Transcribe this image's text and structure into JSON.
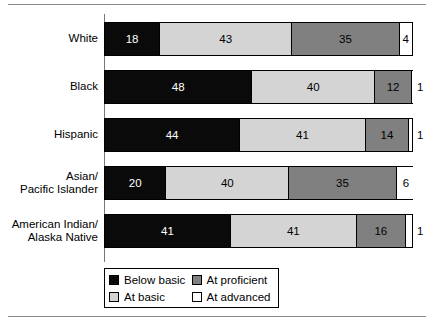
{
  "rules": {
    "top": true,
    "bottom": true
  },
  "chart_data": {
    "type": "bar",
    "orientation": "horizontal",
    "stacked": true,
    "stack_total": 100,
    "title": "",
    "xlabel": "",
    "ylabel": "",
    "xlim": [
      0,
      100
    ],
    "grid": false,
    "legend_position": "bottom",
    "categories": [
      "White",
      "Black",
      "Hispanic",
      "Asian/\nPacific Islander",
      "American Indian/\nAlaska Native"
    ],
    "series": [
      {
        "name": "Below basic",
        "color": "#0a0a0a",
        "values": [
          18,
          48,
          44,
          20,
          41
        ]
      },
      {
        "name": "At basic",
        "color": "#d4d4d4",
        "values": [
          43,
          40,
          41,
          40,
          41
        ]
      },
      {
        "name": "At proficient",
        "color": "#808080",
        "values": [
          35,
          12,
          14,
          35,
          16
        ]
      },
      {
        "name": "At advanced",
        "color": "#ffffff",
        "values": [
          4,
          1,
          1,
          6,
          1
        ]
      }
    ]
  },
  "rows": [
    {
      "label": "White",
      "segments": [
        {
          "key": "below",
          "value": "18",
          "pct": 18,
          "label_inside": true
        },
        {
          "key": "basic",
          "value": "43",
          "pct": 43,
          "label_inside": true
        },
        {
          "key": "prof",
          "value": "35",
          "pct": 35,
          "label_inside": true
        },
        {
          "key": "adv",
          "value": "4",
          "pct": 4,
          "label_inside": true
        }
      ],
      "outside_value": ""
    },
    {
      "label": "Black",
      "segments": [
        {
          "key": "below",
          "value": "48",
          "pct": 48,
          "label_inside": true
        },
        {
          "key": "basic",
          "value": "40",
          "pct": 40,
          "label_inside": true
        },
        {
          "key": "prof",
          "value": "12",
          "pct": 12,
          "label_inside": true
        },
        {
          "key": "adv",
          "value": "1",
          "pct": 1,
          "label_inside": false
        }
      ],
      "outside_value": "1"
    },
    {
      "label": "Hispanic",
      "segments": [
        {
          "key": "below",
          "value": "44",
          "pct": 44,
          "label_inside": true
        },
        {
          "key": "basic",
          "value": "41",
          "pct": 41,
          "label_inside": true
        },
        {
          "key": "prof",
          "value": "14",
          "pct": 14,
          "label_inside": true
        },
        {
          "key": "adv",
          "value": "1",
          "pct": 1,
          "label_inside": false
        }
      ],
      "outside_value": "1"
    },
    {
      "label": "Asian/\nPacific Islander",
      "segments": [
        {
          "key": "below",
          "value": "20",
          "pct": 20,
          "label_inside": true
        },
        {
          "key": "basic",
          "value": "40",
          "pct": 40,
          "label_inside": true
        },
        {
          "key": "prof",
          "value": "35",
          "pct": 35,
          "label_inside": true
        },
        {
          "key": "adv",
          "value": "6",
          "pct": 6,
          "label_inside": true
        }
      ],
      "outside_value": ""
    },
    {
      "label": "American Indian/\nAlaska Native",
      "segments": [
        {
          "key": "below",
          "value": "41",
          "pct": 41,
          "label_inside": true
        },
        {
          "key": "basic",
          "value": "41",
          "pct": 41,
          "label_inside": true
        },
        {
          "key": "prof",
          "value": "16",
          "pct": 16,
          "label_inside": true
        },
        {
          "key": "adv",
          "value": "1",
          "pct": 1,
          "label_inside": false
        }
      ],
      "outside_value": "1"
    }
  ],
  "legend": {
    "items": [
      {
        "key": "below",
        "label": "Below basic",
        "color": "#0a0a0a"
      },
      {
        "key": "prof",
        "label": "At proficient",
        "color": "#808080"
      },
      {
        "key": "basic",
        "label": "At basic",
        "color": "#d4d4d4"
      },
      {
        "key": "adv",
        "label": "At advanced",
        "color": "#ffffff"
      }
    ]
  }
}
